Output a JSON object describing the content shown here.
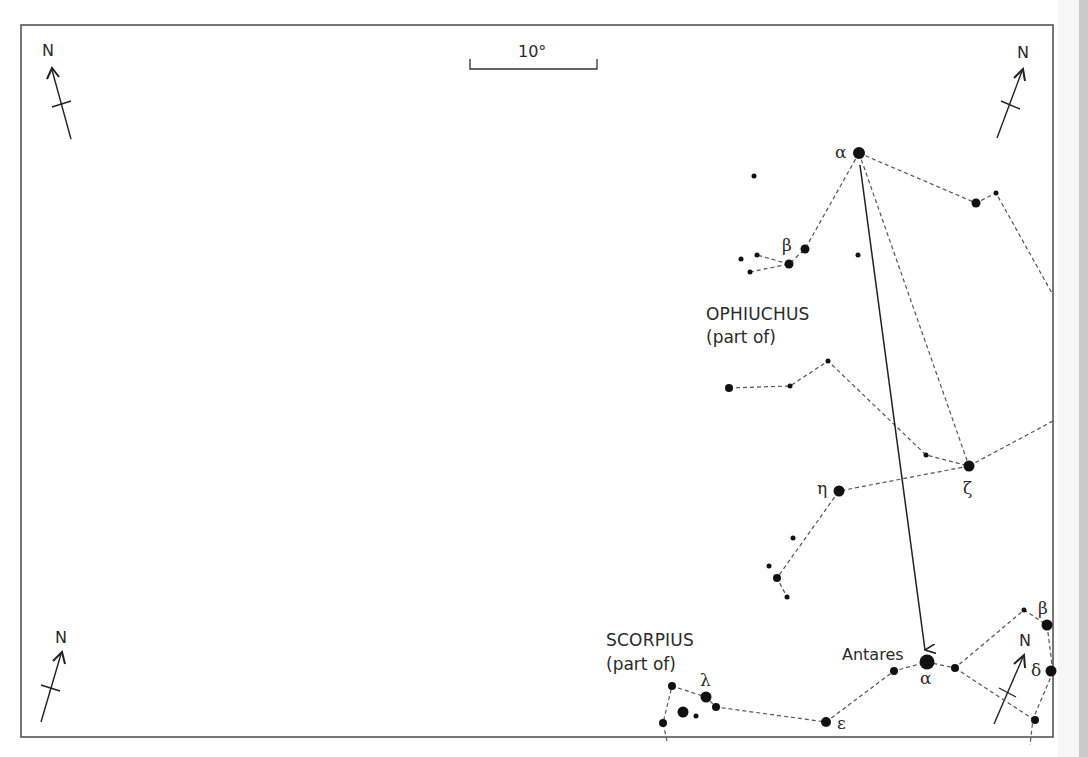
{
  "map": {
    "frame_color": "#555555",
    "ink_color": "#222222",
    "background": "#ffffff",
    "scale_bar": {
      "label": "10°"
    },
    "compass": [
      {
        "id": "top-left",
        "label": "N"
      },
      {
        "id": "top-right",
        "label": "N"
      },
      {
        "id": "bottom-left",
        "label": "N"
      },
      {
        "id": "bottom-right",
        "label": "N"
      }
    ],
    "constellations": [
      {
        "name": "OPHIUCHUS",
        "note": "(part of)"
      },
      {
        "name": "SCORPIUS",
        "note": "(part of)"
      }
    ],
    "star_labels": {
      "oph_alpha": "α",
      "oph_beta": "β",
      "oph_zeta": "ζ",
      "oph_eta": "η",
      "sco_alpha": "α",
      "sco_antares": "Antares",
      "sco_lambda": "λ",
      "sco_epsilon": "ε",
      "sco_beta": "β",
      "sco_delta": "δ"
    },
    "pointer": {
      "from": "Ophiuchus α",
      "to": "Antares"
    }
  }
}
